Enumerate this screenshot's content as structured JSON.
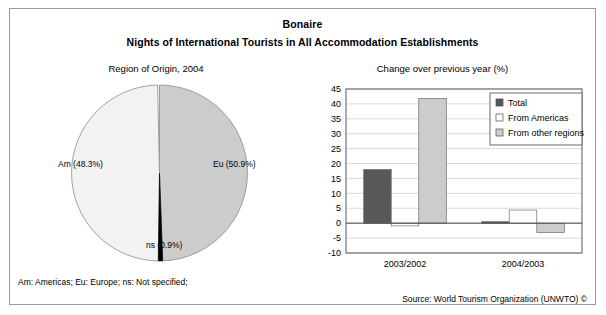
{
  "panel": {
    "title_main": "Bonaire",
    "title_sub": "Nights of International Tourists in All Accommodation Establishments",
    "caption_left": "Region of Origin, 2004",
    "caption_right": "Change over previous year (%)",
    "footnote": "Am: Americas; Eu: Europe; ns: Not specified;",
    "source": "Source: World Tourism Organization (UNWTO) ©",
    "border_color": "#9a9a9a",
    "background": "#ffffff"
  },
  "chart_data": [
    {
      "type": "pie",
      "title": "Region of Origin, 2004",
      "labels": [
        "Eu",
        "Am",
        "ns"
      ],
      "values": [
        50.9,
        48.3,
        0.9
      ],
      "value_labels": [
        "Eu (50.9%)",
        "Am (48.3%)",
        "ns (0.9%)"
      ],
      "colors": [
        "#cccccc",
        "#f2f2f2",
        "#000000"
      ],
      "legend": "none",
      "grid": false,
      "units": "%"
    },
    {
      "type": "bar",
      "title": "Change over previous year (%)",
      "xlabel": "",
      "ylabel": "",
      "categories": [
        "2003/2002",
        "2004/2003"
      ],
      "series": [
        {
          "name": "Total",
          "values": [
            18.0,
            0.5
          ],
          "color": "#585858"
        },
        {
          "name": "From Americas",
          "values": [
            -0.9,
            4.4
          ],
          "color": "#ffffff"
        },
        {
          "name": "From other regions",
          "values": [
            41.8,
            -3.1
          ],
          "color": "#cccccc"
        }
      ],
      "ylim": [
        -10,
        45
      ],
      "yticks": [
        -10,
        -5,
        0,
        5,
        10,
        15,
        20,
        25,
        30,
        35,
        40,
        45
      ],
      "ytick_labels": [
        "-10",
        "-5",
        "0",
        "5",
        "10",
        "15",
        "20",
        "25",
        "30",
        "35",
        "40",
        "45"
      ],
      "grid": true,
      "grid_color": "#c8c8c8",
      "legend_position": "top-right",
      "legend_entries": [
        "Total",
        "From Americas",
        "From other regions"
      ]
    }
  ]
}
